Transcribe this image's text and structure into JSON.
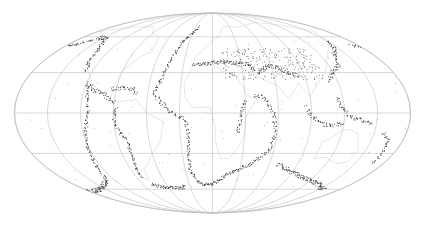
{
  "map": {
    "type": "world-seismicity",
    "projection": "Mollweide",
    "width": 425,
    "height": 229,
    "ellipse": {
      "cx": 212.5,
      "cy": 113,
      "rx": 198,
      "ry": 100
    },
    "graticule": {
      "parallels_deg": [
        -60,
        -30,
        0,
        30,
        60
      ],
      "meridians_deg": [
        -180,
        -150,
        -120,
        -90,
        -60,
        -30,
        0,
        30,
        60,
        90,
        120,
        150,
        180
      ],
      "color": "#c8c8c8"
    },
    "colors": {
      "background": "#ffffff",
      "border": "#bdbdbd",
      "coastline": "#e4e4e4",
      "events": "#333333"
    },
    "central_meridian_deg": 10,
    "event_belts": [
      {
        "name": "Aleutian arc",
        "points": [
          [
            -178,
            52
          ],
          [
            -170,
            52
          ],
          [
            -160,
            54
          ],
          [
            -150,
            58
          ]
        ]
      },
      {
        "name": "North American west coast",
        "points": [
          [
            -150,
            60
          ],
          [
            -135,
            58
          ],
          [
            -125,
            48
          ],
          [
            -122,
            38
          ],
          [
            -116,
            32
          ]
        ]
      },
      {
        "name": "Central America",
        "points": [
          [
            -110,
            22
          ],
          [
            -100,
            17
          ],
          [
            -92,
            14
          ],
          [
            -85,
            10
          ],
          [
            -80,
            8
          ]
        ]
      },
      {
        "name": "Caribbean arc",
        "points": [
          [
            -85,
            18
          ],
          [
            -75,
            19
          ],
          [
            -65,
            18
          ],
          [
            -61,
            14
          ]
        ]
      },
      {
        "name": "Andes",
        "points": [
          [
            -78,
            5
          ],
          [
            -80,
            -5
          ],
          [
            -76,
            -14
          ],
          [
            -71,
            -22
          ],
          [
            -71,
            -32
          ],
          [
            -73,
            -42
          ],
          [
            -75,
            -50
          ]
        ]
      },
      {
        "name": "Scotia arc",
        "points": [
          [
            -70,
            -55
          ],
          [
            -55,
            -58
          ],
          [
            -30,
            -58
          ],
          [
            -27,
            -56
          ]
        ]
      },
      {
        "name": "Mid-Atlantic ridge",
        "points": [
          [
            -15,
            70
          ],
          [
            -30,
            55
          ],
          [
            -35,
            40
          ],
          [
            -40,
            25
          ],
          [
            -45,
            15
          ],
          [
            -30,
            2
          ],
          [
            -15,
            -5
          ],
          [
            -13,
            -15
          ],
          [
            -14,
            -30
          ],
          [
            -15,
            -45
          ],
          [
            -5,
            -55
          ],
          [
            10,
            -55
          ]
        ]
      },
      {
        "name": "Southwest Indian ridge",
        "points": [
          [
            10,
            -55
          ],
          [
            30,
            -45
          ],
          [
            50,
            -38
          ],
          [
            65,
            -28
          ]
        ]
      },
      {
        "name": "Central Indian ridge",
        "points": [
          [
            65,
            -28
          ],
          [
            68,
            -15
          ],
          [
            65,
            0
          ],
          [
            58,
            12
          ],
          [
            48,
            13
          ]
        ]
      },
      {
        "name": "Southeast Indian ridge",
        "points": [
          [
            78,
            -38
          ],
          [
            100,
            -45
          ],
          [
            120,
            -50
          ],
          [
            145,
            -55
          ],
          [
            165,
            -60
          ]
        ]
      },
      {
        "name": "Alpide belt",
        "points": [
          [
            -10,
            36
          ],
          [
            10,
            38
          ],
          [
            20,
            39
          ],
          [
            30,
            38
          ],
          [
            45,
            37
          ],
          [
            55,
            30
          ],
          [
            65,
            35
          ],
          [
            75,
            35
          ],
          [
            85,
            30
          ],
          [
            95,
            28
          ]
        ]
      },
      {
        "name": "Sunda arc",
        "points": [
          [
            95,
            5
          ],
          [
            100,
            -2
          ],
          [
            110,
            -8
          ],
          [
            120,
            -9
          ],
          [
            130,
            -7
          ]
        ]
      },
      {
        "name": "Western Pacific arcs",
        "points": [
          [
            122,
            24
          ],
          [
            128,
            30
          ],
          [
            140,
            36
          ],
          [
            145,
            43
          ],
          [
            155,
            50
          ],
          [
            162,
            56
          ]
        ]
      },
      {
        "name": "Philippines–New Guinea",
        "points": [
          [
            125,
            12
          ],
          [
            126,
            5
          ],
          [
            135,
            -3
          ],
          [
            150,
            -6
          ],
          [
            155,
            -8
          ]
        ]
      },
      {
        "name": "Tonga–Kermadec",
        "points": [
          [
            168,
            -15
          ],
          [
            175,
            -20
          ],
          [
            178,
            -30
          ],
          [
            177,
            -38
          ]
        ]
      },
      {
        "name": "East Pacific rise",
        "points": [
          [
            -108,
            20
          ],
          [
            -105,
            10
          ],
          [
            -103,
            0
          ],
          [
            -110,
            -20
          ],
          [
            -112,
            -30
          ],
          [
            -115,
            -40
          ],
          [
            -118,
            -50
          ],
          [
            -130,
            -55
          ],
          [
            -150,
            -60
          ],
          [
            -170,
            -62
          ]
        ]
      },
      {
        "name": "East African rift",
        "points": [
          [
            40,
            10
          ],
          [
            36,
            0
          ],
          [
            34,
            -8
          ],
          [
            33,
            -15
          ]
        ]
      }
    ]
  }
}
